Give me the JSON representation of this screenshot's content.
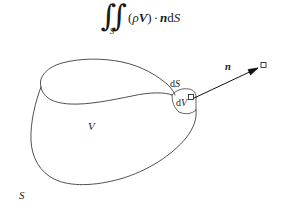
{
  "figure": {
    "name": "flux-through-closed-surface-diagram",
    "background_color": "#ffffff",
    "stroke_color": "#3d3d3d",
    "formula": {
      "integral_glyph": "∫∫",
      "integral_subscript": "S",
      "open_paren": "(",
      "rho": "ρ",
      "vector_V": "V",
      "close_paren": ")",
      "dot_operator": "·",
      "vector_n": "n",
      "d_upright": "d",
      "S_italic": "S",
      "full_text": "∬_S (ρV) · n dS"
    },
    "labels": {
      "volume": "V",
      "surface": "S",
      "area_element_d": "d",
      "area_element_S": "S",
      "volume_element_d": "d",
      "volume_element_V": "V",
      "normal_vector": "n"
    }
  }
}
